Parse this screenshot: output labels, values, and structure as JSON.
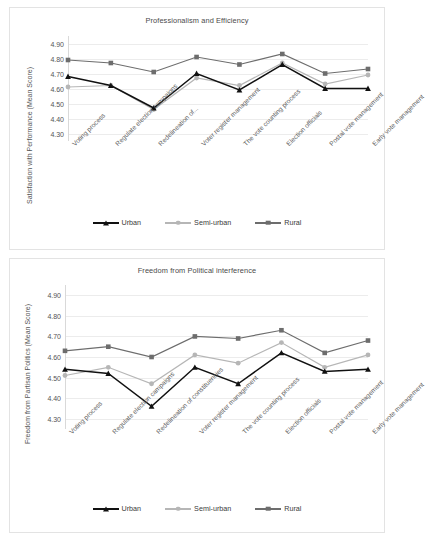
{
  "figure": {
    "background": "#ffffff",
    "panel_border": "#e3e3e3"
  },
  "series_colors": {
    "urban": "#111111",
    "semi_urban": "#b6b6b6",
    "rural": "#6d6d6d"
  },
  "legend": {
    "urban": "Urban",
    "semi_urban": "Semi-urban",
    "rural": "Rural"
  },
  "chart_data": [
    {
      "type": "line",
      "title": "Professionalism and Efficiency",
      "ylabel": "Satisfaction with Performance (Mean Score)",
      "xlabel": "",
      "ylim": [
        4.25,
        4.95
      ],
      "yticks": [
        "4.90",
        "4.80",
        "4.70",
        "4.60",
        "4.50",
        "4.40",
        "4.30"
      ],
      "ytick_values": [
        4.9,
        4.8,
        4.7,
        4.6,
        4.5,
        4.4,
        4.3
      ],
      "grid": true,
      "legend_position": "bottom",
      "categories": [
        "Voting process",
        "Regulate election campaigns",
        "Redelineation of...",
        "Voter register management",
        "The vote counting process",
        "Election officials",
        "Postal vote management",
        "Early vote management"
      ],
      "series": [
        {
          "name": "Urban",
          "marker": "triangle",
          "values": [
            4.68,
            4.62,
            4.47,
            4.7,
            4.59,
            4.76,
            4.6,
            4.6
          ]
        },
        {
          "name": "Semi-urban",
          "marker": "circle",
          "values": [
            4.61,
            4.62,
            4.46,
            4.67,
            4.62,
            4.77,
            4.63,
            4.69
          ]
        },
        {
          "name": "Rural",
          "marker": "square",
          "values": [
            4.79,
            4.77,
            4.71,
            4.81,
            4.76,
            4.83,
            4.7,
            4.73
          ]
        }
      ]
    },
    {
      "type": "line",
      "title": "Freedom from Political interference",
      "ylabel": "Freedom from Partisan Politics (Mean Score)",
      "xlabel": "",
      "ylim": [
        4.25,
        4.95
      ],
      "yticks": [
        "4.90",
        "4.80",
        "4.70",
        "4.60",
        "4.50",
        "4.40",
        "4.30"
      ],
      "ytick_values": [
        4.9,
        4.8,
        4.7,
        4.6,
        4.5,
        4.4,
        4.3
      ],
      "grid": true,
      "legend_position": "bottom",
      "categories": [
        "Voting process",
        "Regulate election campaigns",
        "Redelineation of constituencies",
        "Voter register management",
        "The vote counting process",
        "Election officials",
        "Postal vote management",
        "Early vote management"
      ],
      "series": [
        {
          "name": "Urban",
          "marker": "triangle",
          "values": [
            4.54,
            4.52,
            4.36,
            4.55,
            4.47,
            4.62,
            4.53,
            4.54
          ]
        },
        {
          "name": "Semi-urban",
          "marker": "circle",
          "values": [
            4.51,
            4.55,
            4.47,
            4.61,
            4.57,
            4.67,
            4.55,
            4.61
          ]
        },
        {
          "name": "Rural",
          "marker": "square",
          "values": [
            4.63,
            4.65,
            4.6,
            4.7,
            4.69,
            4.73,
            4.62,
            4.68
          ]
        }
      ]
    }
  ]
}
